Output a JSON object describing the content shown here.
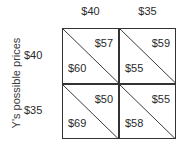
{
  "diagram": {
    "type": "payoff-matrix",
    "row_axis_label": "Y's possible prices",
    "column_labels": [
      "$40",
      "$35"
    ],
    "row_labels": [
      "$40",
      "$35"
    ],
    "cells": [
      [
        {
          "upper_right": "$57",
          "lower_left": "$60"
        },
        {
          "upper_right": "$59",
          "lower_left": "$55"
        }
      ],
      [
        {
          "upper_right": "$50",
          "lower_left": "$69"
        },
        {
          "upper_right": "$55",
          "lower_left": "$58"
        }
      ]
    ]
  }
}
